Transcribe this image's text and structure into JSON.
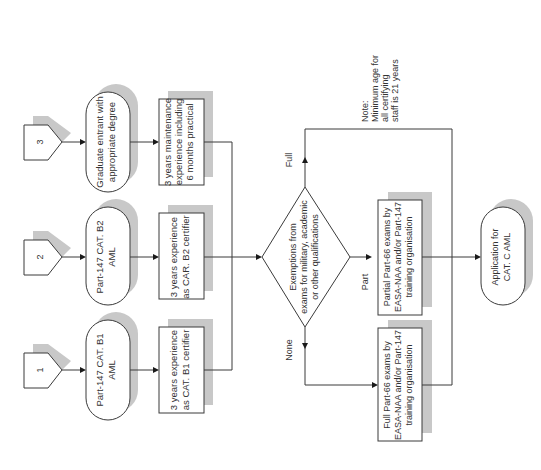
{
  "diagram": {
    "colors": {
      "line": "#3a3a3a",
      "shadow": "#c8c8c8",
      "text": "#333333",
      "background": "#ffffff"
    },
    "connectors": [
      {
        "id": "1",
        "label": "1"
      },
      {
        "id": "2",
        "label": "2"
      },
      {
        "id": "3",
        "label": "3"
      }
    ],
    "start_nodes": [
      {
        "id": "b1",
        "lines": [
          "Part-147 CAT. B1",
          "AML"
        ]
      },
      {
        "id": "b2",
        "lines": [
          "Part-147 CAT. B2",
          "AML"
        ]
      },
      {
        "id": "grad",
        "lines": [
          "Graduate entrant with",
          "appropriate degree"
        ]
      }
    ],
    "experience_boxes": [
      {
        "id": "exp1",
        "lines": [
          "3 years experience",
          "as CAT. B1 certifier"
        ]
      },
      {
        "id": "exp2",
        "lines": [
          "3 years experience",
          "as CAR. B2 certifier"
        ]
      },
      {
        "id": "exp3",
        "lines": [
          "3 years maintenance",
          "experience including",
          "6 months practical"
        ]
      }
    ],
    "decision": {
      "lines": [
        "Exemptions from",
        "exams for military, academic",
        "or other qualifications"
      ],
      "branches": {
        "full": "Full",
        "part": "Part",
        "none": "None"
      }
    },
    "exam_boxes": [
      {
        "id": "partial",
        "lines": [
          "Partial Part-66 exams by",
          "EASA-NAA and/or Part-147",
          "training organisation"
        ]
      },
      {
        "id": "full",
        "lines": [
          "Full Part-66 exams by",
          "EASA-NAA and/or Part-147",
          "training organisation"
        ]
      }
    ],
    "end_node": {
      "lines": [
        "Application for",
        "CAT. C AML"
      ]
    },
    "note": {
      "lines": [
        "Note:",
        "Minimum age for",
        "all certifying",
        "staff is 21 years"
      ]
    }
  }
}
